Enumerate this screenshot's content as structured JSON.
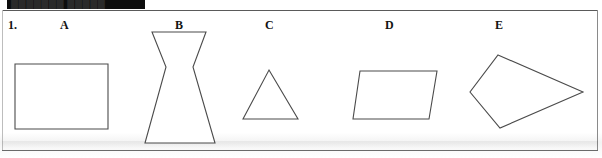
{
  "page": {
    "width": 602,
    "height": 158,
    "background_color": "#ffffff",
    "ink_color": "#4b4b4b",
    "text_color": "#131313"
  },
  "masthead": {
    "name": "redaction-bar",
    "color": "#0d0d0d",
    "obscured_text": "███████ █████"
  },
  "question": {
    "number": "1.",
    "labels": [
      {
        "key": "A",
        "text": "A"
      },
      {
        "key": "B",
        "text": "B"
      },
      {
        "key": "C",
        "text": "C"
      },
      {
        "key": "D",
        "text": "D"
      },
      {
        "key": "E",
        "text": "E"
      }
    ]
  },
  "figures": [
    {
      "label": "A",
      "shape": "rectangle",
      "points": "15,64 108,64 108,129 15,129"
    },
    {
      "label": "B",
      "shape": "concave-hexagon-hourglass",
      "points": "152,32 206,32 193,67 215,143 145,143 166,67"
    },
    {
      "label": "C",
      "shape": "triangle",
      "points": "269,70 298,119 243,119"
    },
    {
      "label": "D",
      "shape": "parallelogram",
      "points": "360,71 437,71 429,119 353,119"
    },
    {
      "label": "E",
      "shape": "kite-quadrilateral",
      "points": "498,55 583,92 500,128 470,92"
    }
  ]
}
